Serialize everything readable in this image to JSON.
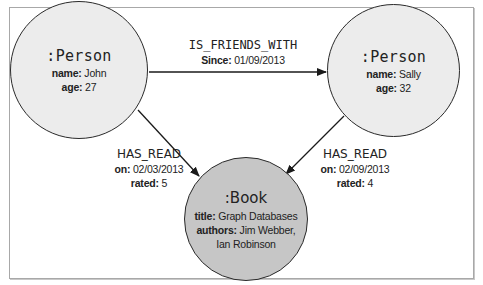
{
  "diagram": {
    "type": "property-graph",
    "nodes": [
      {
        "id": "john",
        "label": ":Person",
        "properties": [
          {
            "key": "name:",
            "value": "John"
          },
          {
            "key": "age:",
            "value": "27"
          }
        ],
        "fill": "#ececec"
      },
      {
        "id": "sally",
        "label": ":Person",
        "properties": [
          {
            "key": "name:",
            "value": "Sally"
          },
          {
            "key": "age:",
            "value": "32"
          }
        ],
        "fill": "#ececec"
      },
      {
        "id": "book",
        "label": ":Book",
        "properties": [
          {
            "key": "title:",
            "value": "Graph Databases"
          },
          {
            "key": "authors:",
            "value": "Jim Webber,"
          },
          {
            "key": "",
            "value": "Ian Robinson"
          }
        ],
        "fill": "#c6c6c6"
      }
    ],
    "relationships": [
      {
        "from": "john",
        "to": "sally",
        "type": "IS_FRIENDS_WITH",
        "properties": [
          {
            "key": "Since:",
            "value": "01/09/2013"
          }
        ]
      },
      {
        "from": "john",
        "to": "book",
        "type": "HAS_READ",
        "properties": [
          {
            "key": "on:",
            "value": "02/03/2013"
          },
          {
            "key": "rated:",
            "value": "5"
          }
        ]
      },
      {
        "from": "sally",
        "to": "book",
        "type": "HAS_READ",
        "properties": [
          {
            "key": "on:",
            "value": "02/09/2013"
          },
          {
            "key": "rated:",
            "value": "4"
          }
        ]
      }
    ]
  }
}
